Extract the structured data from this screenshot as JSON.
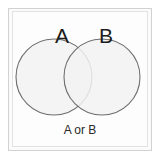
{
  "figure": {
    "type": "venn-diagram",
    "caption": "A or B",
    "background_color": "#fdfdfd",
    "frame_color": "#d2d2d2"
  },
  "chart_data": {
    "type": "venn",
    "title": "",
    "caption": "A or B",
    "operation": "union",
    "sets": [
      {
        "label": "A",
        "cx": 42,
        "cy": 66,
        "r": 38,
        "fill": "#f2f2f2",
        "stroke": "#6e6e6e"
      },
      {
        "label": "B",
        "cx": 90,
        "cy": 66,
        "r": 38,
        "fill": "#f2f2f2",
        "stroke": "#6e6e6e"
      }
    ],
    "regions": [
      {
        "name": "A only",
        "shaded": false
      },
      {
        "name": "A and B",
        "shaded": false
      },
      {
        "name": "B only",
        "shaded": false
      }
    ],
    "grid": false,
    "legend": "none"
  },
  "labels": {
    "set_a": "A",
    "set_b": "B",
    "caption": "A or B"
  }
}
